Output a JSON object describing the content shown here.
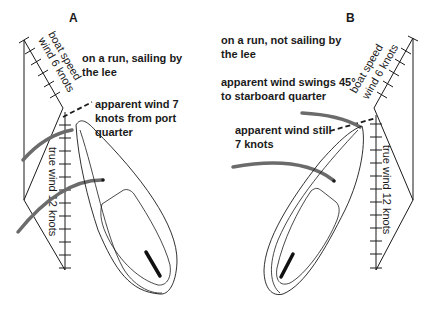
{
  "panels": {
    "A": {
      "letter": "A",
      "caption_line1": "on a run, sailing by",
      "caption_line2": "the lee",
      "apparent_line1": "apparent wind 7",
      "apparent_line2": "knots from port",
      "apparent_line3": "quarter",
      "boat_speed_label": "boat speed",
      "boat_speed_value": "wind 6 knots",
      "true_wind_label": "true wind 12 knots"
    },
    "B": {
      "letter": "B",
      "caption_line1": "on a run, not sailing by",
      "caption_line2": "the lee",
      "swing_line1": "apparent wind swings 45°",
      "swing_line2": "to starboard quarter",
      "apparent_line1": "apparent wind still",
      "apparent_line2": "7 knots",
      "boat_speed_label": "boat speed",
      "boat_speed_value": "wind 6 knots",
      "true_wind_label": "true wind 12 knots"
    }
  },
  "colors": {
    "line": "#1a1a1a",
    "sail_arc": "#6b6b6b",
    "background": "#ffffff"
  }
}
